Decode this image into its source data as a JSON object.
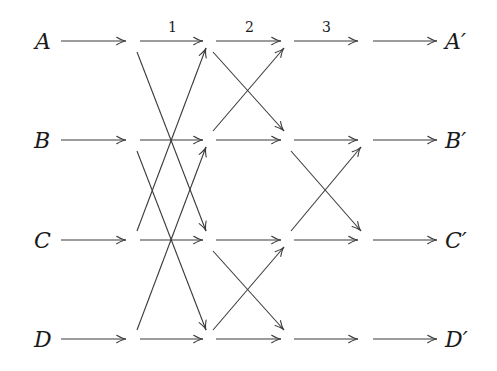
{
  "diagram": {
    "type": "butterfly-permutation-network",
    "inputs": [
      "A",
      "B",
      "C",
      "D"
    ],
    "outputs": [
      "A′",
      "B′",
      "C′",
      "D′"
    ],
    "stage_labels": [
      "1",
      "2",
      "3"
    ],
    "colors": {
      "stroke": "#3a3a3a",
      "text": "#1a1a1a",
      "background": "#ffffff"
    },
    "columns": [
      {
        "name": "input",
        "horizontal": [
          "A",
          "B",
          "C",
          "D"
        ],
        "crossings": []
      },
      {
        "name": "stage-1",
        "label_index": 0,
        "horizontal": [
          "A",
          "B",
          "C",
          "D"
        ],
        "crossings": [
          [
            "A",
            "C"
          ],
          [
            "B",
            "D"
          ]
        ]
      },
      {
        "name": "stage-2",
        "label_index": 1,
        "horizontal": [
          "A",
          "B",
          "C",
          "D"
        ],
        "crossings": [
          [
            "A",
            "B"
          ],
          [
            "C",
            "D"
          ]
        ]
      },
      {
        "name": "stage-3",
        "label_index": 2,
        "horizontal": [
          "A",
          "B",
          "C",
          "D"
        ],
        "crossings": [
          [
            "B",
            "C"
          ]
        ]
      },
      {
        "name": "output",
        "horizontal": [
          "A",
          "B",
          "C",
          "D"
        ],
        "crossings": []
      }
    ]
  }
}
